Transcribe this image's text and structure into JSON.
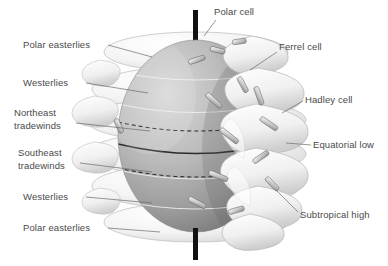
{
  "figure": {
    "background_color": "#ffffff",
    "label_color": "#4a4a4a",
    "globe": {
      "sphere_light": "#cfcfcf",
      "sphere_mid": "#a8a8a8",
      "sphere_dark": "#6e6e6e",
      "cell_fill": "#f2f2f2",
      "cell_edge": "#b9b9b9",
      "axis_color": "#111111",
      "axis_name": "rotation-axis-rod",
      "latitude_lines": [
        {
          "name": "equator",
          "style": "solid"
        },
        {
          "name": "tropic-of-cancer",
          "style": "dashed"
        },
        {
          "name": "tropic-of-capricorn",
          "style": "dashed"
        },
        {
          "name": "cell-boundary-north-high",
          "style": "thin"
        },
        {
          "name": "cell-boundary-north-mid",
          "style": "thin"
        },
        {
          "name": "cell-boundary-south-mid",
          "style": "thin"
        },
        {
          "name": "cell-boundary-south-high",
          "style": "thin"
        }
      ],
      "circulation_cell_rings": 6,
      "wind_arrow_count": 14
    }
  },
  "labels": {
    "left": [
      {
        "id": "polar-easterlies-north",
        "text": "Polar easterlies",
        "lines": [
          "Polar easterlies"
        ],
        "x": 23,
        "y": 40,
        "leader_to_x": 152,
        "leader_to_y": 57
      },
      {
        "id": "westerlies-north",
        "text": "Westerlies",
        "lines": [
          "Westerlies"
        ],
        "x": 23,
        "y": 78,
        "leader_to_x": 148,
        "leader_to_y": 93
      },
      {
        "id": "northeast-tradewinds",
        "text": "Northeast tradewinds",
        "lines": [
          "Northeast",
          "tradewinds"
        ],
        "x": 14,
        "y": 108,
        "leader_to_x": 150,
        "leader_to_y": 131
      },
      {
        "id": "southeast-tradewinds",
        "text": "Southeast tradewinds",
        "lines": [
          "Southeast",
          "tradewinds"
        ],
        "x": 18,
        "y": 148,
        "leader_to_x": 152,
        "leader_to_y": 172
      },
      {
        "id": "westerlies-south",
        "text": "Westerlies",
        "lines": [
          "Westerlies"
        ],
        "x": 23,
        "y": 192,
        "leader_to_x": 152,
        "leader_to_y": 203
      },
      {
        "id": "polar-easterlies-south",
        "text": "Polar easterlies",
        "lines": [
          "Polar easterlies"
        ],
        "x": 23,
        "y": 223,
        "leader_to_x": 160,
        "leader_to_y": 232
      }
    ],
    "right": [
      {
        "id": "polar-cell",
        "text": "Polar cell",
        "lines": [
          "Polar cell"
        ],
        "x": 214,
        "y": 7,
        "leader_to_x": 204,
        "leader_to_y": 36
      },
      {
        "id": "ferrel-cell",
        "text": "Ferrel cell",
        "lines": [
          "Ferrel cell"
        ],
        "x": 279,
        "y": 42,
        "leader_to_x": 241,
        "leader_to_y": 72
      },
      {
        "id": "hadley-cell",
        "text": "Hadley cell",
        "lines": [
          "Hadley cell"
        ],
        "x": 305,
        "y": 95,
        "leader_to_x": 276,
        "leader_to_y": 113
      },
      {
        "id": "equatorial-low",
        "text": "Equatorial low",
        "lines": [
          "Equatorial low"
        ],
        "x": 313,
        "y": 140,
        "leader_to_x": 288,
        "leader_to_y": 142
      },
      {
        "id": "subtropical-high",
        "text": "Subtropical high",
        "lines": [
          "Subtropical high"
        ],
        "x": 300,
        "y": 210,
        "leader_to_x": 272,
        "leader_to_y": 190
      }
    ]
  }
}
